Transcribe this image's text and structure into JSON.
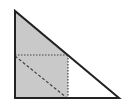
{
  "diagram": {
    "type": "geometry",
    "colors": {
      "background": "#ffffff",
      "shade": "#c9c9c9",
      "stroke": "#222222",
      "dotted": "#444444"
    },
    "triangle": {
      "vertices": [
        [
          15,
          11
        ],
        [
          15,
          98
        ],
        [
          119,
          98
        ]
      ]
    },
    "shaded_region": {
      "points": [
        [
          15,
          11
        ],
        [
          68,
          55
        ],
        [
          68,
          98
        ],
        [
          15,
          98
        ]
      ]
    },
    "dotted_lines": [
      {
        "from": [
          15,
          55
        ],
        "to": [
          68,
          55
        ]
      },
      {
        "from": [
          68,
          55
        ],
        "to": [
          68,
          98
        ]
      }
    ],
    "dashed_lines": [
      {
        "from": [
          15,
          56
        ],
        "to": [
          67,
          98
        ]
      }
    ]
  }
}
